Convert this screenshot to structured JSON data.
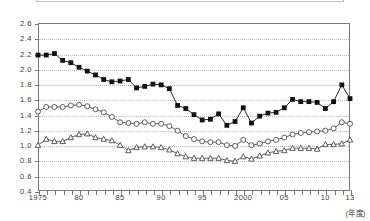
{
  "legend_box": {
    "visible": true,
    "label": ""
  },
  "axes": {
    "y_ticks": [
      "2.6",
      "2.4",
      "2.2",
      "2.0",
      "1.8",
      "1.6",
      "1.4",
      "1.2",
      "1.0",
      "0.8",
      "0.6",
      "0.4"
    ],
    "x_ticks": [
      {
        "year": 1975,
        "label": "1975"
      },
      {
        "year": 1980,
        "label": "80"
      },
      {
        "year": 1985,
        "label": "85"
      },
      {
        "year": 1990,
        "label": "90"
      },
      {
        "year": 1995,
        "label": "95"
      },
      {
        "year": 2000,
        "label": "2000"
      },
      {
        "year": 2005,
        "label": "05"
      },
      {
        "year": 2010,
        "label": "10"
      },
      {
        "year": 2013,
        "label": "13"
      }
    ],
    "x_title": "(年度)"
  },
  "chart_data": {
    "type": "line",
    "title": "",
    "subtitle": "",
    "xlabel": "(年度)",
    "ylabel": "",
    "ylim": [
      0.4,
      2.6
    ],
    "ytick_step": 0.2,
    "xlim": [
      1975,
      2013
    ],
    "grid": "horizontal-dotted",
    "legend": "none-visible",
    "x": [
      1975,
      1976,
      1977,
      1978,
      1979,
      1980,
      1981,
      1982,
      1983,
      1984,
      1985,
      1986,
      1987,
      1988,
      1989,
      1990,
      1991,
      1992,
      1993,
      1994,
      1995,
      1996,
      1997,
      1998,
      1999,
      2000,
      2001,
      2002,
      2003,
      2004,
      2005,
      2006,
      2007,
      2008,
      2009,
      2010,
      2011,
      2012,
      2013
    ],
    "series": [
      {
        "name": "filled-square-series",
        "marker": "filled-square",
        "color": "#111111",
        "values": [
          2.18,
          2.18,
          2.2,
          2.11,
          2.08,
          2.02,
          1.97,
          1.92,
          1.86,
          1.83,
          1.84,
          1.86,
          1.75,
          1.77,
          1.8,
          1.79,
          1.74,
          1.52,
          1.48,
          1.4,
          1.33,
          1.34,
          1.41,
          1.26,
          1.31,
          1.49,
          1.29,
          1.38,
          1.42,
          1.43,
          1.49,
          1.6,
          1.57,
          1.57,
          1.56,
          1.48,
          1.57,
          1.79,
          1.61
        ]
      },
      {
        "name": "open-circle-series",
        "marker": "open-circle",
        "color": "#4d4d4d",
        "values": [
          1.44,
          1.5,
          1.5,
          1.5,
          1.52,
          1.53,
          1.51,
          1.47,
          1.43,
          1.37,
          1.3,
          1.29,
          1.28,
          1.3,
          1.28,
          1.28,
          1.25,
          1.19,
          1.12,
          1.08,
          1.05,
          1.04,
          1.04,
          1.0,
          0.99,
          1.07,
          1.0,
          1.02,
          1.05,
          1.07,
          1.1,
          1.14,
          1.16,
          1.17,
          1.18,
          1.19,
          1.22,
          1.3,
          1.28
        ]
      },
      {
        "name": "open-triangle-series",
        "marker": "open-triangle",
        "color": "#4d4d4d",
        "values": [
          1.0,
          1.08,
          1.05,
          1.05,
          1.1,
          1.14,
          1.15,
          1.1,
          1.08,
          1.06,
          1.0,
          0.93,
          0.97,
          0.98,
          0.98,
          0.97,
          0.94,
          0.89,
          0.85,
          0.83,
          0.83,
          0.83,
          0.83,
          0.8,
          0.79,
          0.85,
          0.82,
          0.86,
          0.9,
          0.92,
          0.93,
          0.96,
          0.96,
          0.96,
          0.95,
          1.01,
          1.01,
          1.02,
          1.07
        ]
      }
    ]
  }
}
